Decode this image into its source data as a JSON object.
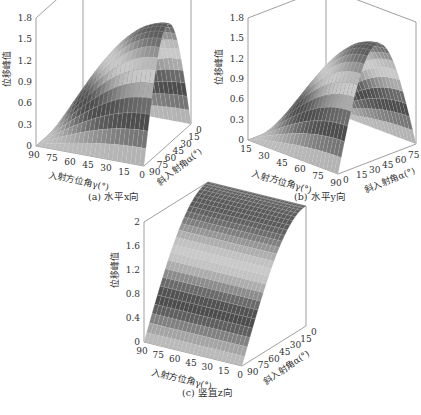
{
  "figure": {
    "panels": [
      {
        "id": "a",
        "caption": "(a) 水平x向"
      },
      {
        "id": "b",
        "caption": "(b) 水平y向"
      },
      {
        "id": "c",
        "caption": "(c) 竖直z向"
      }
    ]
  },
  "chart_data": [
    {
      "type": "surface3d",
      "title": "(a) 水平x向",
      "zlabel": "位移峰值",
      "xlabel": "入射方位角γ(°)",
      "ylabel": "斜入射角α(°)",
      "x_ticks": [
        90,
        75,
        60,
        45,
        30,
        15,
        0
      ],
      "y_ticks": [
        90,
        75,
        60,
        45,
        30,
        15,
        0
      ],
      "z_ticks": [
        0,
        0.3,
        0.6,
        0.9,
        1.2,
        1.5,
        1.8
      ],
      "zlim": [
        0,
        1.8
      ],
      "peak": 1.7,
      "shape": "z ≈ 1.7·cos(γ)·sin(2α)-like ridge; max near γ=0°, α≈45°; zero at γ=90° and α=0°/90°"
    },
    {
      "type": "surface3d",
      "title": "(b) 水平y向",
      "zlabel": "位移峰值",
      "xlabel": "入射方位角γ(°)",
      "ylabel": "斜入射角α(°)",
      "x_ticks": [
        15,
        30,
        45,
        60,
        75,
        90
      ],
      "y_ticks": [
        0,
        15,
        30,
        45,
        60,
        75,
        90
      ],
      "z_ticks": [
        0,
        0.3,
        0.6,
        0.9,
        1.2,
        1.5,
        1.8
      ],
      "zlim": [
        0,
        1.8
      ],
      "peak": 1.7,
      "shape": "z ≈ 1.7·sin(γ)·sin(2α)-like ridge; max near γ=90°, α≈45°; zero at γ=0°"
    },
    {
      "type": "surface3d",
      "title": "(c) 竖直z向",
      "zlabel": "位移峰值",
      "xlabel": "入射方位角γ(°)",
      "ylabel": "斜入射角α(°)",
      "x_ticks": [
        90,
        75,
        60,
        45,
        30,
        15,
        0
      ],
      "y_ticks": [
        90,
        75,
        60,
        45,
        30,
        15,
        0
      ],
      "z_ticks": [
        0,
        0.4,
        0.8,
        1.2,
        1.6,
        2.0
      ],
      "zlim": [
        0,
        2.0
      ],
      "peak": 2.0,
      "shape": "independent of γ; rises from 0 at α=90° to 2.0 at α=0° (cos-shaped)"
    }
  ]
}
